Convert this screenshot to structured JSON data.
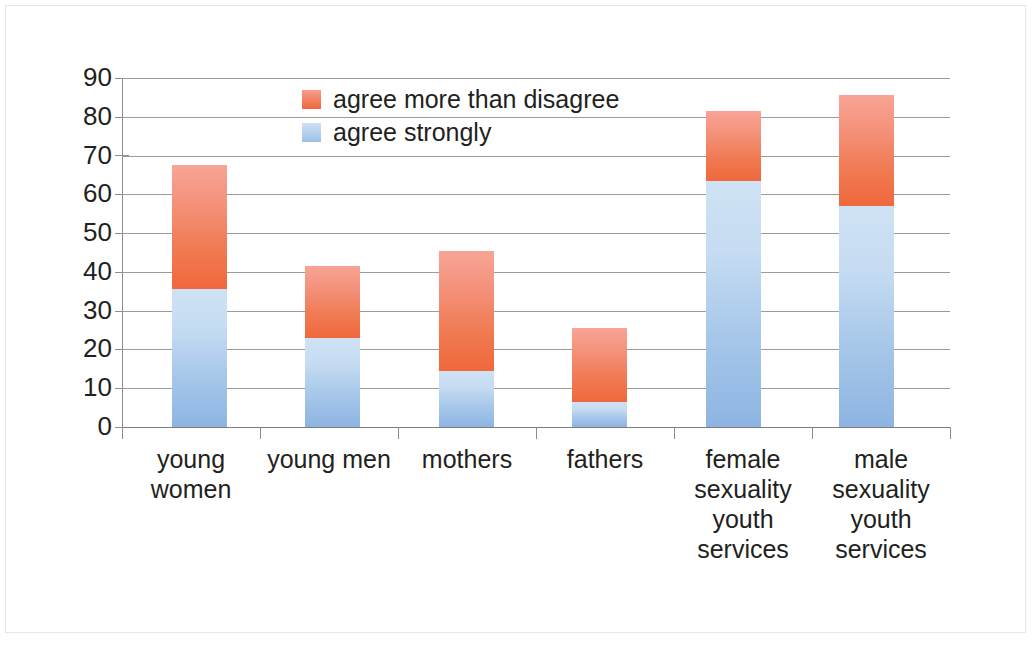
{
  "chart_data": {
    "type": "bar",
    "subtype": "stacked",
    "title": "",
    "xlabel": "",
    "ylabel": "",
    "ylim": [
      0,
      90
    ],
    "grid": true,
    "legend_position": "inside-top-center",
    "y_ticks": [
      0,
      10,
      20,
      30,
      40,
      50,
      60,
      70,
      80,
      90
    ],
    "y_tick_labels": [
      "0",
      "10",
      "20",
      "30",
      "40",
      "50",
      "60",
      "70",
      "80",
      "90"
    ],
    "categories": [
      "young women",
      "young men",
      "mothers",
      "fathers",
      "female sexuality youth services",
      "male sexuality youth services"
    ],
    "category_label_lines": [
      [
        "young",
        "women"
      ],
      [
        "young men"
      ],
      [
        "mothers"
      ],
      [
        "fathers"
      ],
      [
        "female",
        "sexuality",
        "youth",
        "services"
      ],
      [
        "male",
        "sexuality",
        "youth",
        "services"
      ]
    ],
    "series": [
      {
        "name": "agree strongly",
        "color": "#a8c8ea",
        "values": [
          35.5,
          23.0,
          14.5,
          6.5,
          63.5,
          57.0
        ]
      },
      {
        "name": "agree more than disagree",
        "color": "#f07a52",
        "values": [
          32.0,
          18.5,
          31.0,
          19.0,
          18.0,
          28.5
        ]
      }
    ],
    "totals": [
      67.5,
      41.5,
      45.5,
      25.5,
      81.5,
      85.5
    ]
  },
  "legend": {
    "items": [
      {
        "label": "agree more than disagree",
        "swatch": "orange"
      },
      {
        "label": "agree strongly",
        "swatch": "blue"
      }
    ]
  },
  "colors": {
    "orange": "#f07a52",
    "blue": "#a8c8ea",
    "gridline": "#9b9b9b",
    "text": "#231f20",
    "frame": "#b9b9b9"
  }
}
